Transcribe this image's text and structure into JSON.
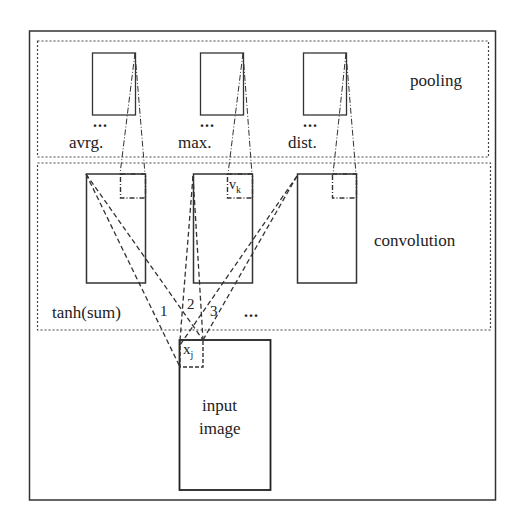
{
  "diagram": {
    "layers": {
      "pooling": {
        "label": "pooling"
      },
      "convolution": {
        "label": "convolution"
      },
      "input": {
        "label_line1": "input",
        "label_line2": "image"
      }
    },
    "pooling_maps": [
      {
        "label": "avrg.",
        "ellipsis": "..."
      },
      {
        "label": "max.",
        "ellipsis": "..."
      },
      {
        "label": "dist.",
        "ellipsis": "..."
      }
    ],
    "convolution": {
      "activation_label": "tanh(sum)",
      "connection_numbers": [
        "1",
        "2",
        "3"
      ],
      "more_maps": "...",
      "unit_label": "v",
      "unit_subscript": "k"
    },
    "input": {
      "unit_label": "x",
      "unit_subscript": "j"
    },
    "colors": {
      "line": "#222222",
      "background": "#ffffff"
    }
  }
}
